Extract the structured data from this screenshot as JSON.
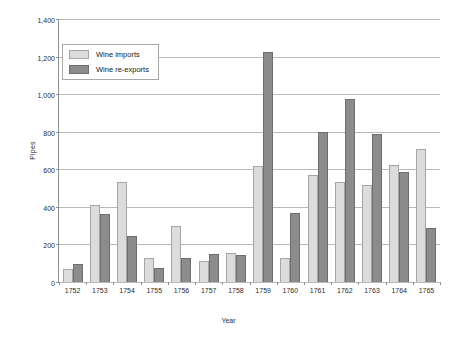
{
  "chart_data": {
    "type": "bar",
    "title": "",
    "xlabel": "Year",
    "ylabel": "Pipes",
    "ylim": [
      0,
      1400
    ],
    "yticks": [
      "0",
      "200",
      "400",
      "600",
      "800",
      "1,000",
      "1,200",
      "1,400"
    ],
    "ytick_values": [
      0,
      200,
      400,
      600,
      800,
      1000,
      1200,
      1400
    ],
    "grid": true,
    "legend_position": "upper left",
    "categories": [
      "1752",
      "1753",
      "1754",
      "1755",
      "1756",
      "1757",
      "1758",
      "1759",
      "1760",
      "1761",
      "1762",
      "1763",
      "1764",
      "1765"
    ],
    "series": [
      {
        "name": "Wine imports",
        "color": "#dcdcdc",
        "values": [
          70,
          410,
          530,
          130,
          300,
          110,
          155,
          615,
          130,
          570,
          535,
          515,
          625,
          710
        ]
      },
      {
        "name": "Wine re-exports",
        "color": "#8c8c8c",
        "values": [
          95,
          360,
          245,
          75,
          130,
          150,
          145,
          1225,
          365,
          800,
          975,
          790,
          585,
          285
        ]
      }
    ]
  },
  "legend": {
    "items": [
      {
        "label": "Wine imports",
        "swatch": "imports"
      },
      {
        "label": "Wine re-exports",
        "swatch": "reexports"
      }
    ]
  }
}
